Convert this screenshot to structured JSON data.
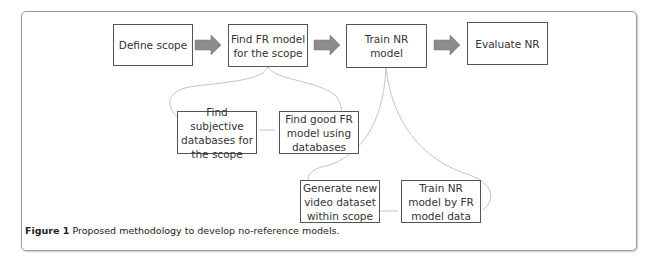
{
  "diagram": {
    "main_flow": [
      {
        "id": "define-scope",
        "label": "Define scope"
      },
      {
        "id": "find-fr-model",
        "label": "Find FR model for the scope"
      },
      {
        "id": "train-nr-model",
        "label": "Train NR model"
      },
      {
        "id": "evaluate-nr",
        "label": "Evaluate NR"
      }
    ],
    "sub_flow_fr": [
      {
        "id": "find-subjective-databases",
        "label": "Find subjective databases for the scope"
      },
      {
        "id": "find-good-fr-model",
        "label": "Find good FR model using databases"
      }
    ],
    "sub_flow_nr": [
      {
        "id": "generate-new-video-dataset",
        "label": "Generate new video dataset within scope"
      },
      {
        "id": "train-nr-by-fr-data",
        "label": "Train NR model  by FR model data"
      }
    ],
    "colors": {
      "arrow": "#8c8c8c",
      "box_border": "#555555",
      "curve": "#c0c0c0"
    }
  },
  "caption": {
    "label": "Figure 1",
    "text": " Proposed methodology to develop no-reference models."
  }
}
